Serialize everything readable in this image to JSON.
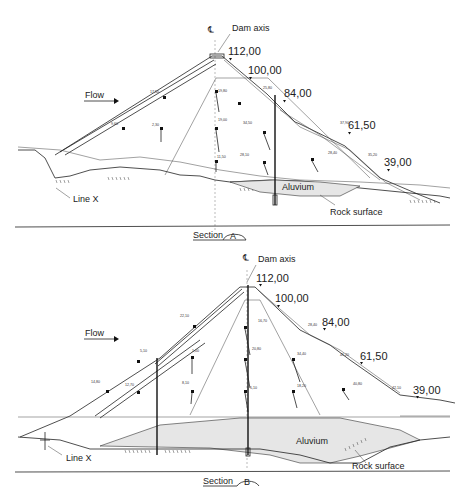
{
  "sections": [
    {
      "id": "A",
      "title": "Section",
      "letter": "A",
      "labels": {
        "centerline": "℄",
        "dam_axis": "Dam axis",
        "flow": "Flow",
        "line_x": "Line X",
        "aluvium": "Aluvium",
        "rock_surface": "Rock surface"
      },
      "elevations": [
        "112,00",
        "100,00",
        "84,00",
        "61,50",
        "39,00"
      ],
      "dimensions": [
        "17,50",
        "9,60",
        "2,30",
        "19,80",
        "19,00",
        "11,50",
        "34,50",
        "28,10",
        "25,80",
        "37,90",
        "28,40",
        "35,20",
        "17,40",
        "20,90",
        "63,00",
        "78,70",
        "128,00",
        "81,20",
        "117,50",
        "71,00",
        "63,70",
        "93,80",
        "48,70",
        "23,60"
      ]
    },
    {
      "id": "B",
      "title": "Section",
      "letter": "B",
      "labels": {
        "centerline": "℄",
        "dam_axis": "Dam axis",
        "flow": "Flow",
        "line_x": "Line X",
        "aluvium": "Aluvium",
        "rock_surface": "Rock surface"
      },
      "elevations": [
        "112,00",
        "100,00",
        "84,00",
        "61,50",
        "39,00"
      ],
      "dimensions": [
        "22,10",
        "5,10",
        "14,80",
        "12,70",
        "1,00",
        "8,10",
        "16,70",
        "20,80",
        "5,10",
        "28,40",
        "34,40",
        "41,20",
        "40,80",
        "42,10",
        "18,20",
        "17,90",
        "23,00",
        "14,00",
        "77,70",
        "60,00",
        "111,00",
        "163,00",
        "100,90",
        "79,80",
        "122,80",
        "87,50",
        "83,00",
        "48,90",
        "27,10",
        "63,50"
      ]
    }
  ]
}
